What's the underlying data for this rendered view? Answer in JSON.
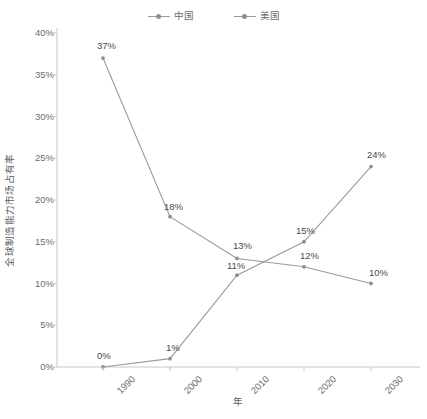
{
  "chart_data": {
    "type": "line",
    "title": "",
    "subtitle": "",
    "xlabel": "年",
    "ylabel": "全球制造能力市场占有率",
    "categories": [
      "1990",
      "2000",
      "2010",
      "2020",
      "2030"
    ],
    "ylim": [
      0,
      40
    ],
    "ytick_labels": [
      "0%",
      "5%",
      "10%",
      "15%",
      "20%",
      "25%",
      "30%",
      "35%",
      "40%"
    ],
    "ytick_values": [
      0,
      5,
      10,
      15,
      20,
      25,
      30,
      35,
      40
    ],
    "grid": false,
    "legend_position": "top-center",
    "series": [
      {
        "name": "中国",
        "color": "#8f8f8f",
        "values": [
          0,
          1,
          11,
          15,
          24
        ],
        "labels": [
          "0%",
          "1%",
          "11%",
          "15%",
          "24%"
        ]
      },
      {
        "name": "美国",
        "color": "#8f8f8f",
        "values": [
          37,
          18,
          13,
          12,
          10
        ],
        "labels": [
          "37%",
          "18%",
          "13%",
          "12%",
          "10%"
        ]
      }
    ]
  },
  "legend": {
    "items": [
      {
        "label": "中国"
      },
      {
        "label": "美国"
      }
    ]
  },
  "axes": {
    "x_title": "年",
    "y_title": "全球制造能力市场占有率",
    "x_ticks": [
      "1990",
      "2000",
      "2010",
      "2020",
      "2030"
    ],
    "y_ticks": [
      "40%",
      "35%",
      "30%",
      "25%",
      "20%",
      "15%",
      "10%",
      "5%",
      "0%"
    ]
  },
  "colors": {
    "series_line": "#9a9a9a",
    "series_marker": "#8f8f8f",
    "axis": "#c8c8c8",
    "tick_text": "#6b6b6b",
    "label_text": "#4a4a4a",
    "background": "#ffffff"
  }
}
